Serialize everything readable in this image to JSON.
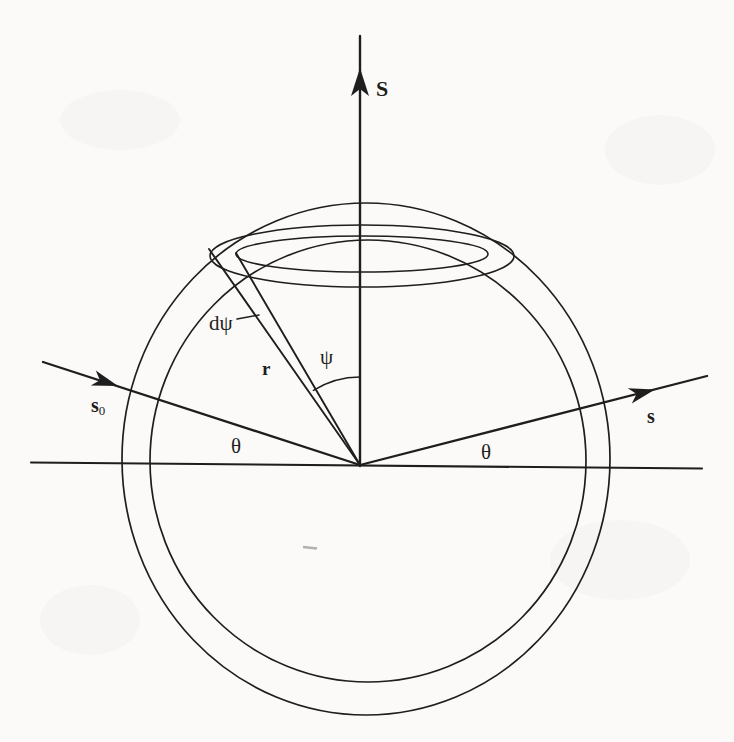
{
  "figure": {
    "type": "scattering-geometry-diagram",
    "background_color": "#fbfaf8",
    "line_color": "#1e1e1e",
    "artifact_color": "#8a8a86"
  },
  "labels": {
    "scattering_vector": "S",
    "incident_ray_main": "s",
    "incident_ray_sub": "0",
    "scattered_ray": "s",
    "radius_vector": "r",
    "theta_left": "θ",
    "theta_right": "θ",
    "psi": "ψ",
    "dpsi": "dψ"
  }
}
